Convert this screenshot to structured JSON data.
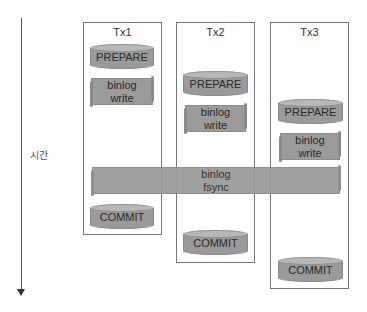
{
  "axis": {
    "label": "시간",
    "direction": "down"
  },
  "transactions": [
    {
      "title": "Tx1",
      "prepare": "PREPARE",
      "binlog_write": [
        "binlog",
        "write"
      ],
      "commit": "COMMIT"
    },
    {
      "title": "Tx2",
      "prepare": "PREPARE",
      "binlog_write": [
        "binlog",
        "write"
      ],
      "commit": "COMMIT"
    },
    {
      "title": "Tx3",
      "prepare": "PREPARE",
      "binlog_write": [
        "binlog",
        "write"
      ],
      "commit": "COMMIT"
    }
  ],
  "shared": {
    "binlog_fsync": [
      "binlog",
      "fsync"
    ]
  },
  "colors": {
    "shape_fill": "#9b9b9b",
    "shape_top": "#b8b8b8",
    "border": "#777777",
    "text": "#333333"
  }
}
